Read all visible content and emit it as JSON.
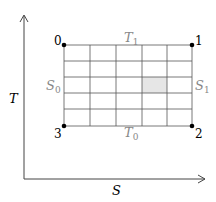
{
  "diagram": {
    "type": "T-S diagram (Carnot cycle grid)",
    "axes": {
      "x_label": "S",
      "y_label": "T"
    },
    "corners": [
      {
        "id": "0",
        "label": "0"
      },
      {
        "id": "1",
        "label": "1"
      },
      {
        "id": "2",
        "label": "2"
      },
      {
        "id": "3",
        "label": "3"
      }
    ],
    "edges": {
      "top": "T",
      "top_sub": "1",
      "bottom": "T",
      "bottom_sub": "0",
      "left": "S",
      "left_sub": "0",
      "right": "S",
      "right_sub": "1"
    },
    "grid": {
      "columns": 5,
      "rows": 5,
      "highlighted_cell": {
        "col": 4,
        "row": 3
      }
    },
    "colors": {
      "axis": "#444444",
      "grid": "#555555",
      "label_gray": "#888888",
      "dot": "#000000",
      "highlight": "#e6e6e6"
    }
  }
}
